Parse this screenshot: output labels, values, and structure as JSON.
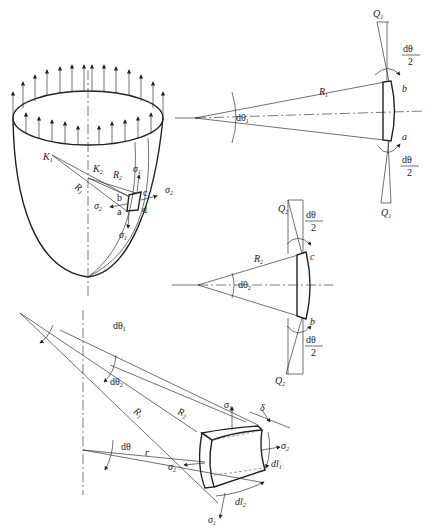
{
  "figure": {
    "views": [
      {
        "id": "shell",
        "description": "Shell of revolution with edge loads, principal radii and surface element abcd"
      },
      {
        "id": "meridional-section",
        "description": "Meridional section of element with angle dθ1"
      },
      {
        "id": "circumferential-section",
        "description": "Circumferential section of element with angle dθ2"
      },
      {
        "id": "element-3d",
        "description": "3D element with thickness δ and edge lengths dl1, dl2"
      }
    ]
  },
  "labels": {
    "K1": "K",
    "K1_sub": "1",
    "K2": "K",
    "K2_sub": "2",
    "R1": "R",
    "R1_sub": "1",
    "R2": "R",
    "R2_sub": "2",
    "sigma1": "σ",
    "sigma1_sub": "1",
    "sigma2": "σ",
    "sigma2_sub": "2",
    "a": "a",
    "b": "b",
    "c": "c",
    "d": "d",
    "Q1": "Q",
    "Q1_sub": "1",
    "Q2": "Q",
    "Q2_sub": "2",
    "dtheta1": "dθ",
    "dtheta1_sub": "1",
    "dtheta2": "dθ",
    "dtheta2_sub": "2",
    "dtheta": "dθ",
    "half_num": "dθ",
    "half_den": "2",
    "r": "r",
    "delta": "δ",
    "dl1": "dl",
    "dl1_sub": "1",
    "dl2": "dl",
    "dl2_sub": "2"
  }
}
